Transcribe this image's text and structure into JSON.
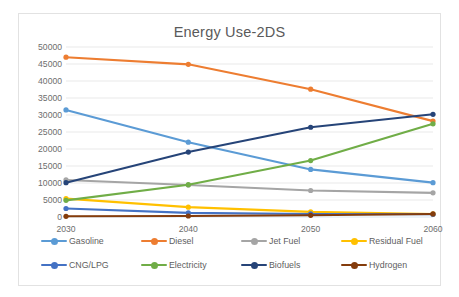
{
  "card": {
    "title": "Energy Use-2DS"
  },
  "chart_data": {
    "type": "line",
    "title": "Energy Use-2DS",
    "xlabel": "",
    "ylabel": "",
    "categories": [
      "2030",
      "2040",
      "2050",
      "2060"
    ],
    "x_tick_labels": [
      "2030",
      "2040",
      "2050",
      "2060"
    ],
    "y_tick_labels": [
      "0",
      "5000",
      "10000",
      "15000",
      "20000",
      "25000",
      "30000",
      "35000",
      "40000",
      "45000",
      "50000"
    ],
    "y_ticks": [
      0,
      5000,
      10000,
      15000,
      20000,
      25000,
      30000,
      35000,
      40000,
      45000,
      50000
    ],
    "ylim": [
      0,
      50000
    ],
    "grid": "horizontal",
    "legend_position": "bottom",
    "markers": "circle",
    "series": [
      {
        "name": "Gasoline",
        "color": "#5B9BD5",
        "values": [
          31500,
          22000,
          14000,
          10100
        ]
      },
      {
        "name": "Diesel",
        "color": "#ED7D31",
        "values": [
          47000,
          44900,
          37600,
          28200
        ]
      },
      {
        "name": "Jet Fuel",
        "color": "#A5A5A5",
        "values": [
          10900,
          9400,
          7800,
          7100
        ]
      },
      {
        "name": "Residual Fuel",
        "color": "#FFC000",
        "values": [
          5400,
          2900,
          1500,
          900
        ]
      },
      {
        "name": "CNG/LPG",
        "color": "#4472C4",
        "values": [
          2500,
          1200,
          900,
          800
        ]
      },
      {
        "name": "Electricity",
        "color": "#70AD47",
        "values": [
          4900,
          9500,
          16600,
          27400
        ]
      },
      {
        "name": "Biofuels",
        "color": "#264478",
        "values": [
          10100,
          19100,
          26400,
          30200
        ]
      },
      {
        "name": "Hydrogen",
        "color": "#843C0C",
        "values": [
          200,
          300,
          500,
          900
        ]
      }
    ]
  },
  "legend": {
    "rows": [
      [
        {
          "label": "Gasoline",
          "color": "#5B9BD5"
        },
        {
          "label": "Diesel",
          "color": "#ED7D31"
        },
        {
          "label": "Jet Fuel",
          "color": "#A5A5A5"
        },
        {
          "label": "Residual Fuel",
          "color": "#FFC000"
        }
      ],
      [
        {
          "label": "CNG/LPG",
          "color": "#4472C4"
        },
        {
          "label": "Electricity",
          "color": "#70AD47"
        },
        {
          "label": "Biofuels",
          "color": "#264478"
        },
        {
          "label": "Hydrogen",
          "color": "#843C0C"
        }
      ]
    ]
  }
}
